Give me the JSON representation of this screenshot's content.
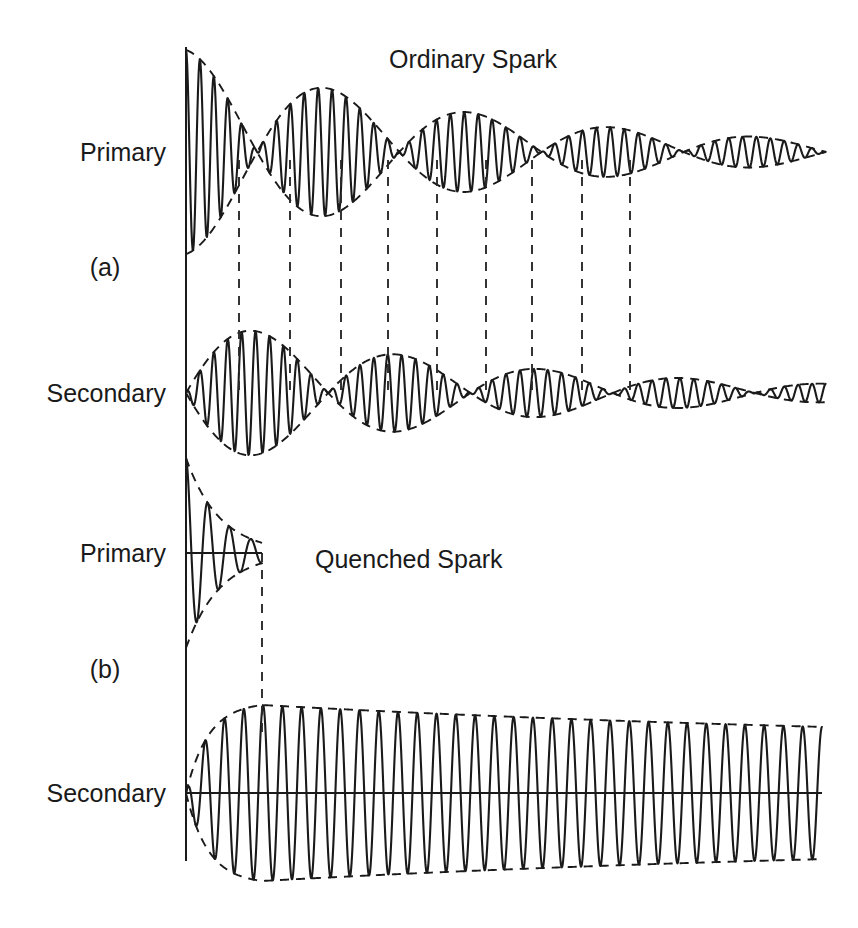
{
  "figure": {
    "background_color": "#ffffff",
    "ink_color": "#1a1a1a",
    "width": 858,
    "height": 928,
    "titles": {
      "ordinary": "Ordinary Spark",
      "quenched": "Quenched Spark"
    },
    "panels": [
      {
        "id": "a",
        "label": "(a)",
        "title": "Ordinary Spark"
      },
      {
        "id": "b",
        "label": "(b)",
        "title": "Quenched Spark"
      }
    ],
    "row_labels": {
      "primary": "Primary",
      "secondary": "Secondary"
    },
    "traces": [
      {
        "name": "ordinary-primary",
        "panel": "a",
        "role": "Primary"
      },
      {
        "name": "ordinary-secondary",
        "panel": "a",
        "role": "Secondary"
      },
      {
        "name": "quenched-primary",
        "panel": "b",
        "role": "Primary"
      },
      {
        "name": "quenched-secondary",
        "panel": "b",
        "role": "Secondary"
      }
    ]
  },
  "chart_data": {
    "type": "line",
    "xlabel": "",
    "ylabel": "",
    "grid": false,
    "legend": "none",
    "annotations": [
      "Ordinary Spark",
      "Quenched Spark",
      "(a)",
      "(b)",
      "Primary",
      "Secondary"
    ],
    "series": [
      {
        "name": "Ordinary Spark - Primary",
        "panel": "a",
        "role": "Primary",
        "waveform": "beating",
        "description": "Damped carrier modulated by beat envelope; energy sloshes back and forth between primary and secondary, producing repeated nodes and antinodes with overall exponential decay.",
        "baseline_y": 152,
        "x_start": 186,
        "x_end": 826,
        "carrier_cycles": 46,
        "beat_periods": 4.5,
        "initial_amplitude": 102,
        "final_amplitude": 11,
        "overall_decay_tau": 300,
        "beat_node_x": [
          239,
          341,
          437,
          532,
          630
        ],
        "envelope_style": "dashed"
      },
      {
        "name": "Ordinary Spark - Secondary",
        "panel": "a",
        "role": "Secondary",
        "waveform": "beating-antiphase",
        "description": "Same beat frequency as primary but in antiphase: secondary antinodes align with primary nodes, showing energy transfer between the two coupled circuits.",
        "baseline_y": 393,
        "x_start": 186,
        "x_end": 826,
        "carrier_cycles": 46,
        "beat_periods": 4.5,
        "initial_amplitude": 0,
        "peak_amplitude": 78,
        "final_amplitude": 9,
        "overall_decay_tau": 300,
        "beat_node_x": [
          186,
          290,
          388,
          486,
          582
        ],
        "envelope_style": "dashed"
      },
      {
        "name": "Quenched Spark - Primary",
        "panel": "b",
        "role": "Primary",
        "waveform": "rapid-decay-truncated",
        "description": "Primary oscillation is quenched after about three cycles; the spark gap extinguishes and the primary stops ringing, transferring all energy to the secondary.",
        "baseline_y": 553,
        "x_start": 186,
        "x_end": 262,
        "carrier_cycles": 3.5,
        "initial_amplitude": 95,
        "final_amplitude": 8,
        "overall_decay_tau": 34,
        "envelope_style": "dashed"
      },
      {
        "name": "Quenched Spark - Secondary",
        "panel": "b",
        "role": "Secondary",
        "waveform": "single-train-slow-decay",
        "description": "Secondary rings as one clean wavetrain with slow exponential decay and no beats, giving a sharply tuned single-frequency emission.",
        "baseline_y": 793,
        "x_start": 186,
        "x_end": 822,
        "carrier_cycles": 33,
        "rise_x_end": 262,
        "peak_amplitude": 88,
        "final_amplitude": 46,
        "overall_decay_tau": 760,
        "envelope_style": "dashed"
      }
    ],
    "connectors": {
      "style": "dashed-vertical",
      "description": "Dashed vertical lines link beat nodes of the primary to the corresponding antinodes of the secondary, and mark the quench instant.",
      "ordinary_x": [
        239,
        290,
        341,
        388,
        437,
        486,
        532,
        582,
        630
      ],
      "quenched_x": [
        262
      ]
    }
  }
}
